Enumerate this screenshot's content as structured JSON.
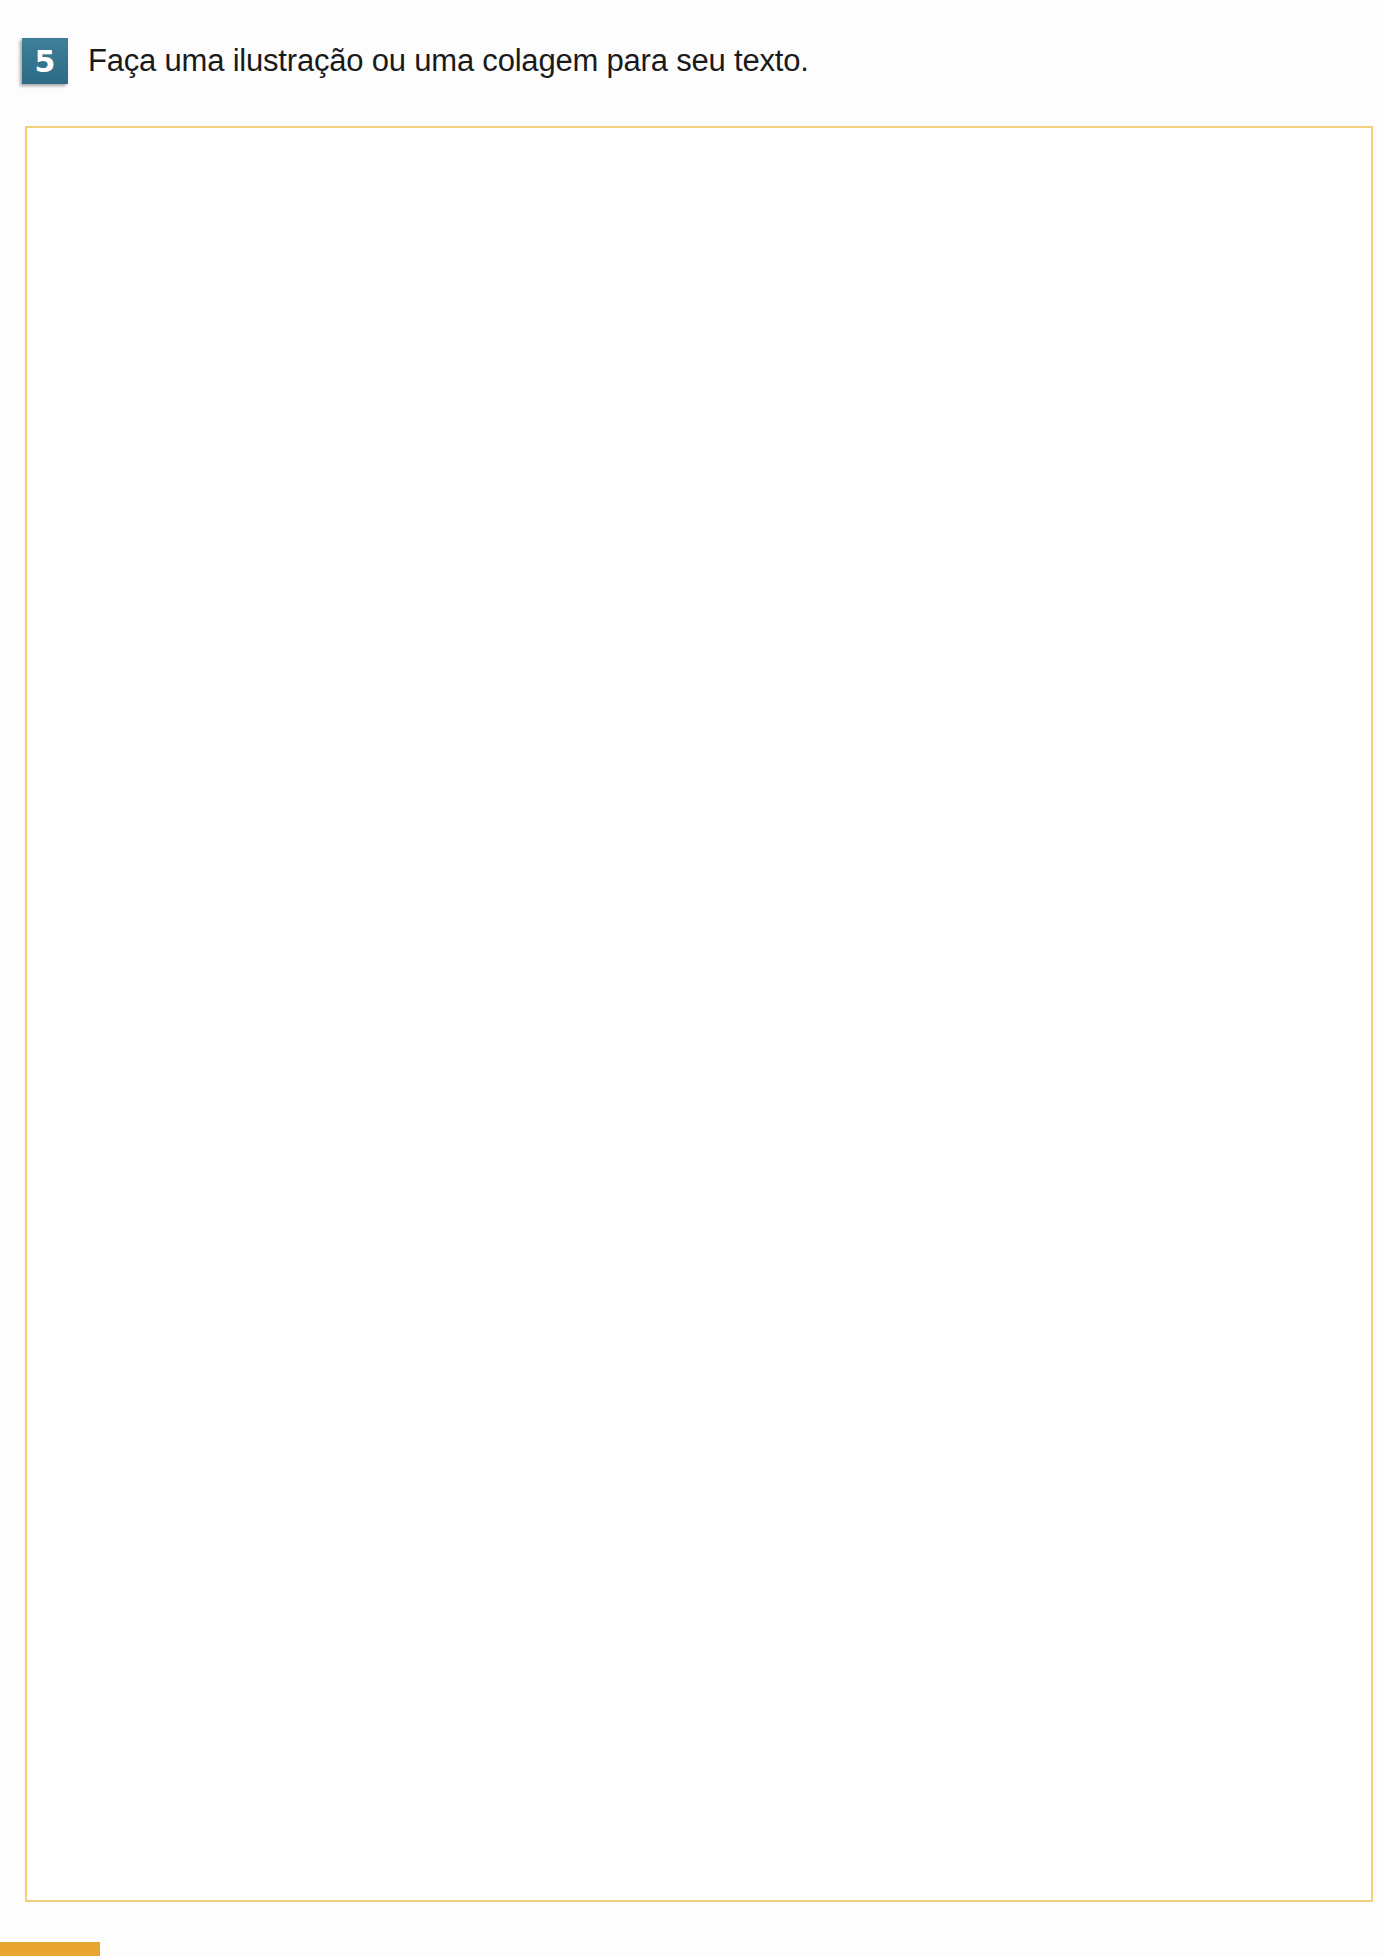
{
  "exercise": {
    "number": "5",
    "instruction": "Faça uma ilustração ou uma colagem para seu texto."
  },
  "drawing_area": {
    "content": "",
    "border_color": "#f2cf7a"
  },
  "page_tab": {
    "label": "",
    "color": "#e9a531"
  },
  "colors": {
    "badge": "#2e6b86",
    "text": "#1a1a1a"
  }
}
